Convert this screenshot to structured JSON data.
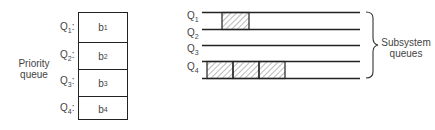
{
  "priority_queue": {
    "title_line1": "Priority",
    "title_line2": "queue",
    "rows": [
      {
        "q": "Q",
        "q_sub": "1",
        "b": "b",
        "b_sub": "1"
      },
      {
        "q": "Q",
        "q_sub": "2",
        "b": "b",
        "b_sub": "2"
      },
      {
        "q": "Q",
        "q_sub": "3",
        "b": "b",
        "b_sub": "3"
      },
      {
        "q": "Q",
        "q_sub": "4",
        "b": "b",
        "b_sub": "4"
      }
    ]
  },
  "subsystem_queues": {
    "title_line1": "Subsystem",
    "title_line2": "queues",
    "rows": [
      {
        "q": "Q",
        "q_sub": "1",
        "blocks": 1
      },
      {
        "q": "Q",
        "q_sub": "2",
        "blocks": 0
      },
      {
        "q": "Q",
        "q_sub": "3",
        "blocks": 0
      },
      {
        "q": "Q",
        "q_sub": "4",
        "blocks": 3
      }
    ]
  },
  "colors": {
    "line": "#222222",
    "text": "#444444",
    "hatch": "#555555"
  }
}
